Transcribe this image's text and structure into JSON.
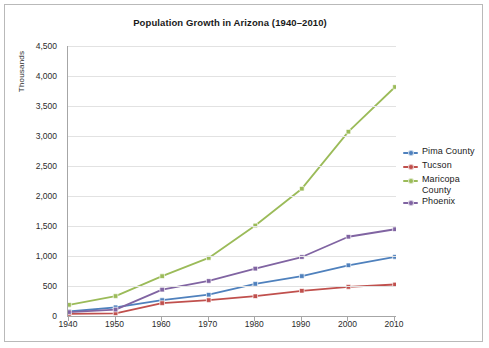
{
  "chart_data": {
    "type": "line",
    "title": "Population Growth in Arizona (1940–2010)",
    "xlabel": "",
    "ylabel": "Thousands",
    "x": [
      1940,
      1950,
      1960,
      1970,
      1980,
      1990,
      2000,
      2010
    ],
    "xtick_labels": [
      "1940",
      "1950",
      "1960",
      "1970",
      "1980",
      "1990",
      "2000",
      "2010"
    ],
    "ytick_labels": [
      "0",
      "500",
      "1,000",
      "1,500",
      "2,000",
      "2,500",
      "3,000",
      "3,500",
      "4,000",
      "4,500"
    ],
    "ytick_values": [
      0,
      500,
      1000,
      1500,
      2000,
      2500,
      3000,
      3500,
      4000,
      4500
    ],
    "ylim": [
      0,
      4500
    ],
    "xlim": [
      1940,
      2010
    ],
    "grid": "horizontal",
    "legend_position": "right",
    "series": [
      {
        "name": "Pima County",
        "color": "#4F81BD",
        "values": [
          75,
          145,
          265,
          355,
          535,
          665,
          845,
          985
        ]
      },
      {
        "name": "Tucson",
        "color": "#C0504D",
        "values": [
          35,
          45,
          215,
          265,
          330,
          420,
          485,
          525
        ]
      },
      {
        "name": "Maricopa County",
        "color": "#9BBB59",
        "values": [
          186,
          332,
          664,
          968,
          1509,
          2122,
          3072,
          3817
        ]
      },
      {
        "name": "Phoenix",
        "color": "#8064A2",
        "values": [
          65,
          107,
          439,
          584,
          790,
          983,
          1321,
          1446
        ]
      }
    ]
  },
  "legend": {
    "entries": [
      {
        "label": "Pima County"
      },
      {
        "label": "Tucson"
      },
      {
        "label": "Maricopa County"
      },
      {
        "label": "Phoenix"
      }
    ]
  },
  "colors": {
    "pima": "#4F81BD",
    "tucson": "#C0504D",
    "maricopa": "#9BBB59",
    "phoenix": "#8064A2",
    "gridline": "#E2E2E2",
    "axis": "#A6A6A6",
    "frame": "#B9B9B9",
    "text": "#1A1A1A",
    "background": "#FFFFFF"
  }
}
